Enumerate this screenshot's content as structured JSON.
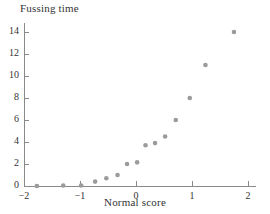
{
  "chart_data": {
    "type": "scatter",
    "title": "Fussing time",
    "xlabel": "Normal score",
    "ylabel": "",
    "xlim": [
      -2,
      2.15
    ],
    "ylim": [
      0,
      14.8
    ],
    "grid": false,
    "legend": "none",
    "xticks": [
      -2,
      -1,
      0,
      1,
      2
    ],
    "xtick_labels": [
      "−2",
      "−1",
      "0",
      "1",
      "2"
    ],
    "yticks": [
      0,
      2,
      4,
      6,
      8,
      10,
      12,
      14
    ],
    "ytick_labels": [
      "0",
      "2",
      "4",
      "6",
      "8",
      "10",
      "12",
      "14"
    ],
    "marker_color": "#9b9b9b",
    "axis_color": "#8a8a8a",
    "points": [
      {
        "x": -1.77,
        "y": 0.0
      },
      {
        "x": -1.3,
        "y": 0.05
      },
      {
        "x": -0.98,
        "y": 0.05
      },
      {
        "x": -0.73,
        "y": 0.4
      },
      {
        "x": -0.53,
        "y": 0.7
      },
      {
        "x": -0.33,
        "y": 1.0
      },
      {
        "x": -0.16,
        "y": 2.0
      },
      {
        "x": 0.02,
        "y": 2.15
      },
      {
        "x": 0.17,
        "y": 3.7
      },
      {
        "x": 0.34,
        "y": 3.9
      },
      {
        "x": 0.52,
        "y": 4.5
      },
      {
        "x": 0.71,
        "y": 6.0
      },
      {
        "x": 0.96,
        "y": 8.0
      },
      {
        "x": 1.24,
        "y": 11.0
      },
      {
        "x": 1.75,
        "y": 14.0
      }
    ]
  }
}
